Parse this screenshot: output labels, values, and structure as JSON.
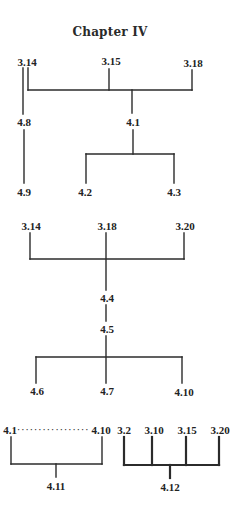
{
  "title": "Chapter IV",
  "colors": {
    "ink": "#2b2b2b",
    "background": "#ffffff"
  },
  "diagram_1": {
    "nodes": {
      "n3_14": {
        "label": "3.14",
        "x": 27,
        "y": 57
      },
      "n3_15": {
        "label": "3.15",
        "x": 111,
        "y": 56
      },
      "n3_18": {
        "label": "3.18",
        "x": 193,
        "y": 58
      },
      "n4_8": {
        "label": "4.8",
        "x": 24,
        "y": 117
      },
      "n4_1": {
        "label": "4.1",
        "x": 133,
        "y": 117
      },
      "n4_9": {
        "label": "4.9",
        "x": 24,
        "y": 187
      },
      "n4_2": {
        "label": "4.2",
        "x": 85,
        "y": 187
      },
      "n4_3": {
        "label": "4.3",
        "x": 174,
        "y": 187
      }
    },
    "edges": [
      [
        "3.14",
        "4.8"
      ],
      [
        "4.8",
        "4.9"
      ],
      [
        "3.14",
        "4.1"
      ],
      [
        "3.15",
        "4.1"
      ],
      [
        "3.18",
        "4.1"
      ],
      [
        "4.1",
        "4.2"
      ],
      [
        "4.1",
        "4.3"
      ]
    ]
  },
  "diagram_2": {
    "nodes": {
      "n3_14": {
        "label": "3.14",
        "x": 31,
        "y": 221
      },
      "n3_18": {
        "label": "3.18",
        "x": 107,
        "y": 221
      },
      "n3_20": {
        "label": "3.20",
        "x": 185,
        "y": 221
      },
      "n4_4": {
        "label": "4.4",
        "x": 107,
        "y": 293
      },
      "n4_5": {
        "label": "4.5",
        "x": 107,
        "y": 324
      },
      "n4_6": {
        "label": "4.6",
        "x": 37,
        "y": 386
      },
      "n4_7": {
        "label": "4.7",
        "x": 107,
        "y": 386
      },
      "n4_10": {
        "label": "4.10",
        "x": 184,
        "y": 387
      }
    },
    "edges": [
      [
        "3.14",
        "4.4"
      ],
      [
        "3.18",
        "4.4"
      ],
      [
        "3.20",
        "4.4"
      ],
      [
        "4.4",
        "4.5"
      ],
      [
        "4.5",
        "4.6"
      ],
      [
        "4.5",
        "4.7"
      ],
      [
        "4.5",
        "4.10"
      ]
    ]
  },
  "diagram_3": {
    "nodes": {
      "n4_1": {
        "label": "4.1",
        "x": 10,
        "y": 425
      },
      "dots": {
        "label": "·················",
        "x": 53,
        "y": 425
      },
      "n4_10": {
        "label": "4.10",
        "x": 101,
        "y": 425
      },
      "n4_11": {
        "label": "4.11",
        "x": 56,
        "y": 481
      }
    },
    "range_note": "4.1 through 4.10",
    "edges": [
      [
        "4.1…4.10",
        "4.11"
      ]
    ]
  },
  "diagram_4": {
    "nodes": {
      "n3_2": {
        "label": "3.2",
        "x": 124,
        "y": 425
      },
      "n3_10": {
        "label": "3.10",
        "x": 154,
        "y": 425
      },
      "n3_15": {
        "label": "3.15",
        "x": 187,
        "y": 425
      },
      "n3_20": {
        "label": "3.20",
        "x": 220,
        "y": 425
      },
      "n4_12": {
        "label": "4.12",
        "x": 170,
        "y": 482
      }
    },
    "edges": [
      [
        "3.2",
        "4.12"
      ],
      [
        "3.10",
        "4.12"
      ],
      [
        "3.15",
        "4.12"
      ],
      [
        "3.20",
        "4.12"
      ]
    ]
  }
}
